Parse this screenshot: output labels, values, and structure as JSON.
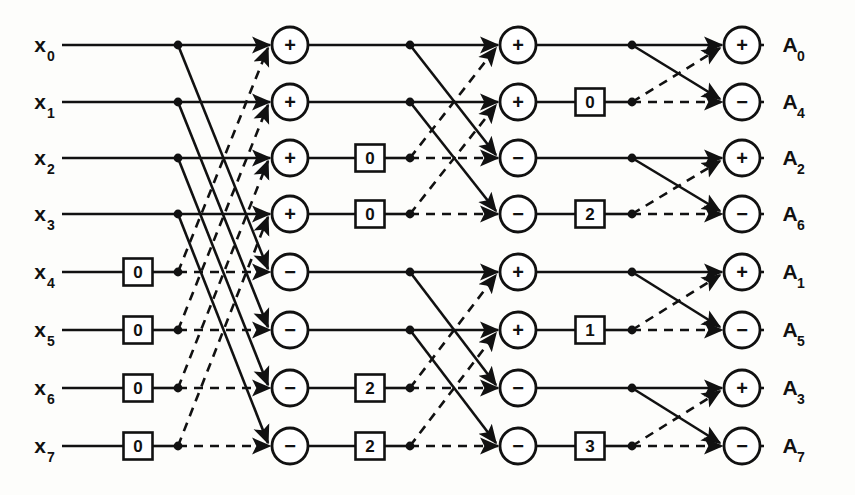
{
  "figure": {
    "type": "butterfly-flow-diagram",
    "width": 855,
    "height": 495,
    "background_color": "#fdfdfb",
    "line_color": "#111111"
  },
  "inputs": [
    {
      "base": "x",
      "sub": "0",
      "row": 0
    },
    {
      "base": "x",
      "sub": "1",
      "row": 1
    },
    {
      "base": "x",
      "sub": "2",
      "row": 2
    },
    {
      "base": "x",
      "sub": "3",
      "row": 3
    },
    {
      "base": "x",
      "sub": "4",
      "row": 4
    },
    {
      "base": "x",
      "sub": "5",
      "row": 5
    },
    {
      "base": "x",
      "sub": "6",
      "row": 6
    },
    {
      "base": "x",
      "sub": "7",
      "row": 7
    }
  ],
  "outputs": [
    {
      "base": "A",
      "sub": "0",
      "row": 0
    },
    {
      "base": "A",
      "sub": "4",
      "row": 1
    },
    {
      "base": "A",
      "sub": "2",
      "row": 2
    },
    {
      "base": "A",
      "sub": "6",
      "row": 3
    },
    {
      "base": "A",
      "sub": "1",
      "row": 4
    },
    {
      "base": "A",
      "sub": "5",
      "row": 5
    },
    {
      "base": "A",
      "sub": "3",
      "row": 6
    },
    {
      "base": "A",
      "sub": "7",
      "row": 7
    }
  ],
  "row_y": [
    45,
    102,
    158,
    214,
    272,
    330,
    388,
    446
  ],
  "columns": {
    "label_x": 40,
    "line_start_x": 62,
    "twiddle0_x": 138,
    "node0_x": 178,
    "circle1_x": 290,
    "twiddle1_x": 370,
    "node1_x": 410,
    "circle2_x": 518,
    "twiddle2_x": 590,
    "node2_x": 632,
    "circle3_x": 742,
    "out_label_x": 790
  },
  "twiddle_boxes": [
    {
      "stage": 0,
      "row": 4,
      "value": "0"
    },
    {
      "stage": 0,
      "row": 5,
      "value": "0"
    },
    {
      "stage": 0,
      "row": 6,
      "value": "0"
    },
    {
      "stage": 0,
      "row": 7,
      "value": "0"
    },
    {
      "stage": 1,
      "row": 2,
      "value": "0"
    },
    {
      "stage": 1,
      "row": 3,
      "value": "0"
    },
    {
      "stage": 1,
      "row": 6,
      "value": "2"
    },
    {
      "stage": 1,
      "row": 7,
      "value": "2"
    },
    {
      "stage": 2,
      "row": 1,
      "value": "0"
    },
    {
      "stage": 2,
      "row": 3,
      "value": "2"
    },
    {
      "stage": 2,
      "row": 5,
      "value": "1"
    },
    {
      "stage": 2,
      "row": 7,
      "value": "3"
    }
  ],
  "operator_nodes": [
    {
      "stage": 1,
      "row": 0,
      "op": "+"
    },
    {
      "stage": 1,
      "row": 1,
      "op": "+"
    },
    {
      "stage": 1,
      "row": 2,
      "op": "+"
    },
    {
      "stage": 1,
      "row": 3,
      "op": "+"
    },
    {
      "stage": 1,
      "row": 4,
      "op": "−"
    },
    {
      "stage": 1,
      "row": 5,
      "op": "−"
    },
    {
      "stage": 1,
      "row": 6,
      "op": "−"
    },
    {
      "stage": 1,
      "row": 7,
      "op": "−"
    },
    {
      "stage": 2,
      "row": 0,
      "op": "+"
    },
    {
      "stage": 2,
      "row": 1,
      "op": "+"
    },
    {
      "stage": 2,
      "row": 2,
      "op": "−"
    },
    {
      "stage": 2,
      "row": 3,
      "op": "−"
    },
    {
      "stage": 2,
      "row": 4,
      "op": "+"
    },
    {
      "stage": 2,
      "row": 5,
      "op": "+"
    },
    {
      "stage": 2,
      "row": 6,
      "op": "−"
    },
    {
      "stage": 2,
      "row": 7,
      "op": "−"
    },
    {
      "stage": 3,
      "row": 0,
      "op": "+"
    },
    {
      "stage": 3,
      "row": 1,
      "op": "−"
    },
    {
      "stage": 3,
      "row": 2,
      "op": "+"
    },
    {
      "stage": 3,
      "row": 3,
      "op": "−"
    },
    {
      "stage": 3,
      "row": 4,
      "op": "+"
    },
    {
      "stage": 3,
      "row": 5,
      "op": "−"
    },
    {
      "stage": 3,
      "row": 6,
      "op": "+"
    },
    {
      "stage": 3,
      "row": 7,
      "op": "−"
    }
  ],
  "stages": [
    {
      "index": 1,
      "half": 4,
      "groups": [
        [
          0,
          1,
          2,
          3,
          4,
          5,
          6,
          7
        ]
      ],
      "note": "rows 0-3 pair with rows 4-7"
    },
    {
      "index": 2,
      "half": 2,
      "groups": [
        [
          0,
          1,
          2,
          3
        ],
        [
          4,
          5,
          6,
          7
        ]
      ],
      "note": "rows pair at distance 2"
    },
    {
      "index": 3,
      "half": 1,
      "groups": [
        [
          0,
          1
        ],
        [
          2,
          3
        ],
        [
          4,
          5
        ],
        [
          6,
          7
        ]
      ],
      "note": "adjacent rows pair"
    }
  ],
  "edge_styles": {
    "upper_solid": "solid",
    "lower_dashed": "dashed"
  }
}
